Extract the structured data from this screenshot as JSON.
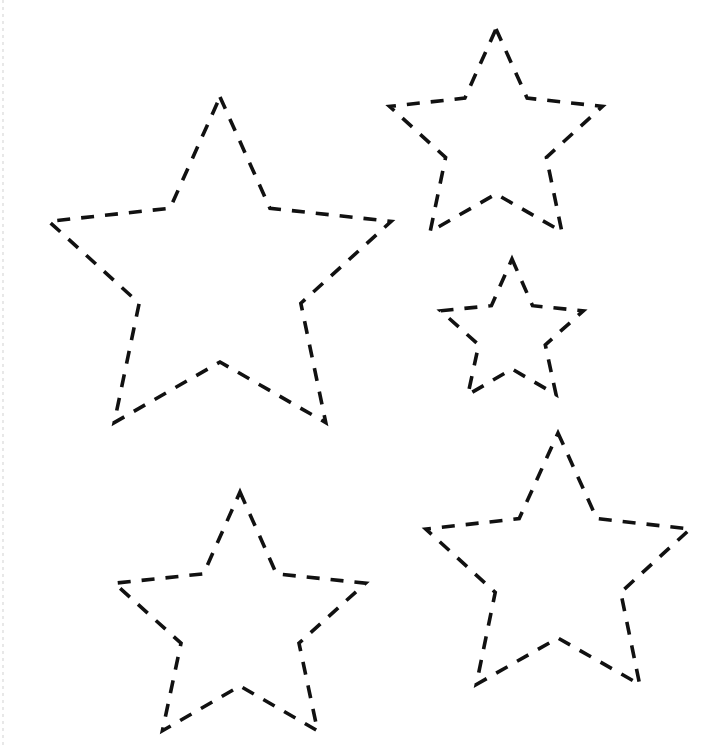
{
  "page": {
    "width": 723,
    "height": 748,
    "background_color": "#ffffff",
    "stroke_color": "#111111",
    "stroke_width": 3.6,
    "dash_length": 13,
    "dash_gap": 11,
    "line_cap": "butt",
    "line_join": "miter",
    "fill": "none"
  },
  "artifacts": {
    "left_scan_edge": {
      "name": "left-scan-edge",
      "visible": true,
      "x": 2,
      "color": "#787878"
    }
  },
  "shapes": [
    {
      "id": "star-large",
      "label": "Large star",
      "size_rank": 1,
      "points": 5,
      "center_x": 220,
      "center_y": 277,
      "outer_radius": 180,
      "inner_radius": 85,
      "rotation_deg": 0,
      "vertices_outer": [
        [
          220,
          97
        ],
        [
          391,
          152
        ],
        [
          326,
          459
        ],
        [
          114,
          459
        ],
        [
          49,
          152
        ]
      ],
      "tip_top": [
        220,
        97
      ],
      "tip_left": [
        30,
        241
      ],
      "tip_right": [
        408,
        242
      ],
      "tip_bottom_left": [
        105,
        465
      ],
      "tip_bottom_right": [
        336,
        465
      ]
    },
    {
      "id": "star-top-right",
      "label": "Upper right star",
      "size_rank": 3,
      "points": 5,
      "center_x": 496,
      "center_y": 141,
      "outer_radius": 112,
      "inner_radius": 53,
      "rotation_deg": 0,
      "tip_top": [
        496,
        29
      ],
      "tip_left": [
        397,
        106
      ],
      "tip_right": [
        595,
        105
      ],
      "tip_bottom_left": [
        437,
        223
      ],
      "tip_bottom_right": [
        556,
        223
      ]
    },
    {
      "id": "star-middle-right-small",
      "label": "Small right star",
      "size_rank": 5,
      "points": 5,
      "center_x": 512,
      "center_y": 334,
      "outer_radius": 75,
      "inner_radius": 35,
      "rotation_deg": 0,
      "tip_top": [
        512,
        259
      ],
      "tip_left": [
        440,
        312
      ],
      "tip_right": [
        586,
        311
      ],
      "tip_bottom_left": [
        468,
        401
      ],
      "tip_bottom_right": [
        557,
        401
      ]
    },
    {
      "id": "star-bottom-left",
      "label": "Lower left star",
      "size_rank": 4,
      "points": 5,
      "center_x": 240,
      "center_y": 624,
      "outer_radius": 132,
      "inner_radius": 62,
      "rotation_deg": 0,
      "tip_top": [
        240,
        492
      ],
      "tip_left": [
        130,
        578
      ],
      "tip_right": [
        352,
        577
      ],
      "tip_bottom_left": [
        173,
        711
      ],
      "tip_bottom_right": [
        308,
        711
      ]
    },
    {
      "id": "star-bottom-right",
      "label": "Lower right star",
      "size_rank": 2,
      "points": 5,
      "center_x": 558,
      "center_y": 572,
      "outer_radius": 139,
      "inner_radius": 66,
      "rotation_deg": 0,
      "tip_top": [
        558,
        433
      ],
      "tip_left": [
        426,
        531
      ],
      "tip_right": [
        691,
        530
      ],
      "tip_bottom_left": [
        477,
        693
      ],
      "tip_bottom_right": [
        641,
        693
      ]
    }
  ]
}
